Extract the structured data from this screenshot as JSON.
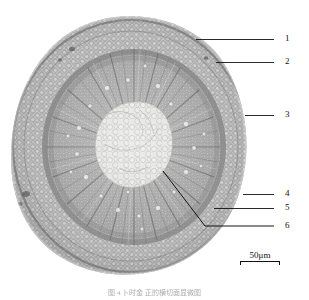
{
  "figure": {
    "kind": "light-micrograph",
    "background_color": "#ffffff",
    "image_tone": "grayscale",
    "caption": "图 4   卜时金 正的横切面显微图"
  },
  "micrograph": {
    "alt_name": "root-cross-section-micrograph",
    "center_x": 131,
    "center_y": 145,
    "outer_radius_x": 120,
    "outer_radius_y": 128,
    "zones": [
      {
        "name": "epidermis",
        "label": "outer epidermal layer",
        "tone": "#7d7d7d"
      },
      {
        "name": "cortex",
        "label": "parenchymatous cortex",
        "tone": "#b4b4b4"
      },
      {
        "name": "phloem",
        "label": "phloem band",
        "tone": "#8a8a8a"
      },
      {
        "name": "xylem",
        "label": "radially striated xylem",
        "tone": "#989898"
      },
      {
        "name": "pith",
        "label": "central pith",
        "tone": "#dedede"
      }
    ]
  },
  "callouts": [
    {
      "id": "1",
      "label": "1",
      "line": {
        "x1": 196,
        "y1": 39,
        "x2": 274,
        "y2": 39
      },
      "num_x": 285,
      "num_y": 34
    },
    {
      "id": "2",
      "label": "2",
      "line": {
        "x1": 216,
        "y1": 62,
        "x2": 274,
        "y2": 62
      },
      "num_x": 285,
      "num_y": 57
    },
    {
      "id": "3",
      "label": "3",
      "line": {
        "x1": 245,
        "y1": 115,
        "x2": 274,
        "y2": 115
      },
      "num_x": 285,
      "num_y": 110
    },
    {
      "id": "4",
      "label": "4",
      "line": {
        "x1": 243,
        "y1": 194,
        "x2": 274,
        "y2": 194
      },
      "num_x": 285,
      "num_y": 189
    },
    {
      "id": "5",
      "label": "5",
      "line": {
        "x1": 214,
        "y1": 208,
        "x2": 274,
        "y2": 208
      },
      "num_x": 285,
      "num_y": 203
    },
    {
      "id": "6",
      "label": "6",
      "polyline": "163,171 205,226 274,226",
      "num_x": 285,
      "num_y": 221
    }
  ],
  "scalebar": {
    "value": "50",
    "unit": "μm",
    "text": "50μm",
    "bar_color": "#111111"
  }
}
